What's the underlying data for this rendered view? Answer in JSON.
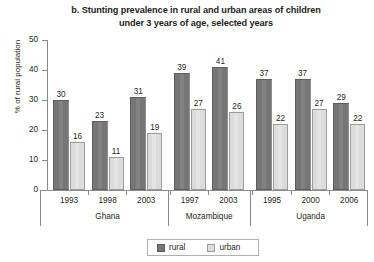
{
  "chart_data": {
    "type": "bar",
    "title": "b. Stunting prevalence in rural and urban areas of children under 3 years of age, selected years",
    "title_line1": "b. Stunting prevalence in rural and urban areas of children",
    "title_line2": "under 3 years of age, selected years",
    "xlabel": "",
    "ylabel": "% of rural population",
    "ylim": [
      0,
      50
    ],
    "yticks": [
      0,
      10,
      20,
      30,
      40,
      50
    ],
    "ytick_labels": [
      "0",
      "10",
      "20",
      "30",
      "40",
      "50"
    ],
    "grid": false,
    "legend_position": "bottom-center",
    "categories": [
      "1993",
      "1998",
      "2003",
      "1997",
      "2003",
      "1995",
      "2000",
      "2006"
    ],
    "groups": [
      {
        "name": "Ghana",
        "years": [
          "1993",
          "1998",
          "2003"
        ]
      },
      {
        "name": "Mozambique",
        "years": [
          "1997",
          "2003"
        ]
      },
      {
        "name": "Uganda",
        "years": [
          "1995",
          "2000",
          "2006"
        ]
      }
    ],
    "series": [
      {
        "name": "rural",
        "color": "#767676",
        "values": [
          30,
          23,
          31,
          39,
          41,
          37,
          37,
          29
        ]
      },
      {
        "name": "urban",
        "color": "#dcdcdc",
        "values": [
          16,
          11,
          19,
          27,
          26,
          22,
          27,
          22
        ]
      }
    ],
    "points": [
      {
        "group": "Ghana",
        "year": "1993",
        "rural": 30,
        "urban": 16
      },
      {
        "group": "Ghana",
        "year": "1998",
        "rural": 23,
        "urban": 11
      },
      {
        "group": "Ghana",
        "year": "2003",
        "rural": 31,
        "urban": 19
      },
      {
        "group": "Mozambique",
        "year": "1997",
        "rural": 39,
        "urban": 27
      },
      {
        "group": "Mozambique",
        "year": "2003",
        "rural": 41,
        "urban": 26
      },
      {
        "group": "Uganda",
        "year": "1995",
        "rural": 37,
        "urban": 22
      },
      {
        "group": "Uganda",
        "year": "2000",
        "rural": 37,
        "urban": 27
      },
      {
        "group": "Uganda",
        "year": "2006",
        "rural": 29,
        "urban": 22
      }
    ]
  },
  "legend": {
    "rural_label": "rural",
    "urban_label": "urban"
  },
  "colors": {
    "rural": "#767676",
    "urban": "#dcdcdc",
    "axis": "#8b8b8b",
    "text": "#231f20",
    "background": "#ffffff"
  }
}
